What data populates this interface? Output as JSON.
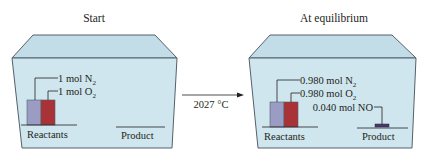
{
  "panels": [
    {
      "title": "Start",
      "reactants_label": "Reactants",
      "product_label": "Product",
      "labels": [
        {
          "text": "1 mol N",
          "sub": "2"
        },
        {
          "text": "1 mol O",
          "sub": "2"
        }
      ],
      "bars": {
        "n2": 1.0,
        "o2": 1.0,
        "no": 0.0
      }
    },
    {
      "title": "At equilibrium",
      "reactants_label": "Reactants",
      "product_label": "Product",
      "labels": [
        {
          "text": "0.980 mol N",
          "sub": "2"
        },
        {
          "text": "0.980 mol O",
          "sub": "2"
        },
        {
          "text": "0.040 mol NO",
          "sub": ""
        }
      ],
      "bars": {
        "n2": 0.98,
        "o2": 0.98,
        "no": 0.04
      }
    }
  ],
  "arrow": {
    "label": "2027 °C"
  },
  "colors": {
    "box_fill": "#cfe6ee",
    "box_top": "#c2dde8",
    "edge": "#55606a",
    "n2_bar": "#9a9cc4",
    "o2_bar": "#a83236",
    "no_bar": "#4a3a6a"
  }
}
